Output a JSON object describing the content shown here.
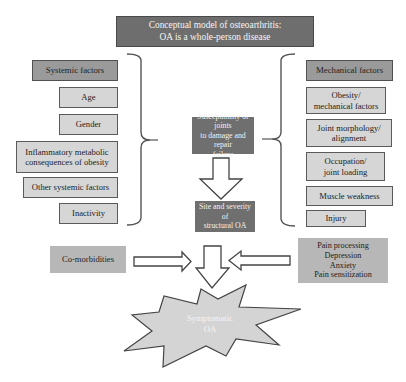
{
  "title": {
    "line1": "Conceptual model of osteoarthritis:",
    "line2": "OA is a whole-person disease"
  },
  "systemic": {
    "header": "Systemic factors",
    "items": [
      {
        "label": "Age"
      },
      {
        "label": "Gender"
      },
      {
        "line1": "Inflammatory metabolic",
        "line2": "consequences of obesity"
      },
      {
        "label": "Other systemic factors"
      },
      {
        "label": "Inactivity"
      }
    ]
  },
  "mechanical": {
    "header": "Mechanical factors",
    "items": [
      {
        "line1": "Obesity/",
        "line2": "mechanical factors"
      },
      {
        "line1": "Joint morphology/",
        "line2": "alignment"
      },
      {
        "line1": "Occupation/",
        "line2": "joint loading"
      },
      {
        "label": "Muscle weakness"
      },
      {
        "label": "Injury"
      }
    ]
  },
  "center": {
    "susceptibility": {
      "line1": "Susceptibility of joints",
      "line2": "to damage and repair",
      "line3": "failure"
    },
    "site": {
      "line1": "Site and severity of",
      "line2": "structural OA"
    }
  },
  "modifiers": {
    "comorbidities": "Co-morbidities",
    "psych": [
      "Pain processing",
      "Depression",
      "Anxiety",
      "Pain sensitization"
    ]
  },
  "outcome": {
    "line1": "Symptomatic",
    "line2": "OA"
  },
  "colors": {
    "title_fill": "#6e6e6e",
    "header_fill": "#9a9a9a",
    "item_fill": "#d6d6d6",
    "center_fill": "#6f6f6f",
    "modifier_fill": "#b7b7b7",
    "star_fill": "#d4d4d4"
  }
}
